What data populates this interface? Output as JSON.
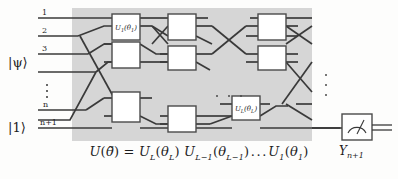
{
  "figure": {
    "type": "quantum-circuit-diagram",
    "caption_equation": {
      "lhs": "U(θ⃗)",
      "rhs": "U_L(θ_L) U_{L-1}(θ_{L-1}) … U_1(θ_1)",
      "plain": "U(θ̃) = U_L(θ_L) U_{L−1}(θ_{L−1}) … U_1(θ_1)"
    },
    "panel": {
      "fill": "#d6d6d6",
      "x": 72,
      "y": 8,
      "width": 240,
      "height": 133
    },
    "colors": {
      "wire": "#3a3a3a",
      "gate_fill": "#ffffff",
      "gate_stroke": "#4a4a4a",
      "background": "#fdfdfc",
      "text": "#1c1c1c"
    }
  },
  "inputs": {
    "state_ket": "|ψ⟩",
    "ancilla_ket": "|1⟩"
  },
  "wires": [
    {
      "label": "1",
      "y": 18
    },
    {
      "label": "2",
      "y": 36
    },
    {
      "label": "3",
      "y": 54
    },
    {
      "label": "",
      "y": 72
    },
    {
      "label": "n",
      "y": 110
    },
    {
      "label": "n+1",
      "y": 128
    }
  ],
  "wire_label_vdots": "⋮",
  "gates": [
    {
      "id": "g1",
      "label": "U₁(θ₁)",
      "base": "U",
      "sub": "1",
      "arg": "θ",
      "argsub": "1",
      "column": 1,
      "row": "top",
      "has_label": true
    },
    {
      "id": "g2",
      "label": "",
      "column": 1,
      "row": "mid",
      "has_label": false
    },
    {
      "id": "g3",
      "label": "",
      "column": 1,
      "row": "bottom",
      "has_label": false
    },
    {
      "id": "g4",
      "label": "",
      "column": 2,
      "row": "top",
      "has_label": false
    },
    {
      "id": "g5",
      "label": "",
      "column": 2,
      "row": "mid",
      "has_label": false
    },
    {
      "id": "g6",
      "label": "",
      "column": 2,
      "row": "bottom",
      "has_label": false
    },
    {
      "id": "g7",
      "label": "",
      "column": 3,
      "row": "top",
      "has_label": false
    },
    {
      "id": "g8",
      "label": "",
      "column": 3,
      "row": "mid",
      "has_label": false
    },
    {
      "id": "g9",
      "label": "Uₗ(θₗ)",
      "base": "U",
      "sub": "L",
      "arg": "θ",
      "argsub": "L",
      "column": 3,
      "row": "bottom",
      "has_label": true
    }
  ],
  "ellipses": {
    "horizontal_center": "⋯",
    "vertical_right": "⋮",
    "vertical_left_labels": "⋮"
  },
  "measurement": {
    "name": "meter-gate",
    "label": "Y",
    "label_sub": "n+1",
    "label_full": "Yₙ₊₁",
    "output": "double-line-classical"
  }
}
